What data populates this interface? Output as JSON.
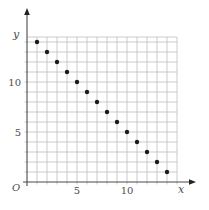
{
  "chart_data": {
    "type": "scatter",
    "title": "",
    "xlabel": "x",
    "ylabel": "y",
    "origin_label": "O",
    "x": [
      1,
      2,
      3,
      4,
      5,
      6,
      7,
      8,
      9,
      10,
      11,
      12,
      13,
      14
    ],
    "y": [
      14,
      13,
      12,
      11,
      10,
      9,
      8,
      7,
      6,
      5,
      4,
      3,
      2,
      1
    ],
    "xlim": [
      0,
      15
    ],
    "ylim": [
      0,
      14.5
    ],
    "x_ticks": [
      5,
      10
    ],
    "y_ticks": [
      5,
      10
    ],
    "grid": true,
    "grid_step": 1,
    "legend": false,
    "colors": {
      "point": "#1a1a1a",
      "grid": "#b9b9b9",
      "axis": "#4a4a4a",
      "arrow": "#222222",
      "tick_text": "#4d4d4d",
      "background": "#ffffff"
    }
  }
}
